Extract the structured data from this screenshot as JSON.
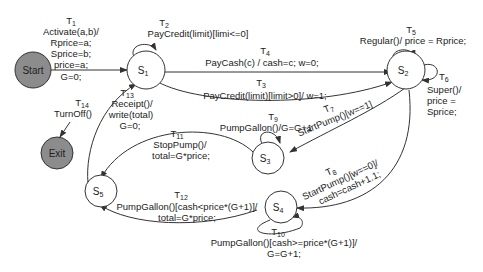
{
  "diagram": {
    "type": "state-machine",
    "colors": {
      "terminal_fill": "#8c8c8c",
      "state_fill": "#ffffff",
      "stroke": "#333333"
    },
    "states": {
      "start": "Start",
      "exit": "Exit",
      "s1": "S",
      "s1_sub": "1",
      "s2": "S",
      "s2_sub": "2",
      "s3": "S",
      "s3_sub": "3",
      "s4": "S",
      "s4_sub": "4",
      "s5": "S",
      "s5_sub": "5"
    },
    "transitions": {
      "t1": {
        "id": "T",
        "sub": "1",
        "lines": [
          "Activate(a,b)/",
          "Rprice=a;",
          "Sprice=b;",
          "price=a;",
          "G=0;"
        ]
      },
      "t2": {
        "id": "T",
        "sub": "2",
        "lines": [
          "PayCredit(limit)[limi<=0]"
        ]
      },
      "t3": {
        "id": "T",
        "sub": "3",
        "lines": [
          "PayCredit(limit)[limit>0]/ w=1;"
        ]
      },
      "t4": {
        "id": "T",
        "sub": "4",
        "lines": [
          "PayCash(c) / cash=c; w=0;"
        ]
      },
      "t5": {
        "id": "T",
        "sub": "5",
        "lines": [
          "Regular()/ price = Rprice;"
        ]
      },
      "t6": {
        "id": "T",
        "sub": "6",
        "lines": [
          "Super()/",
          "price =",
          "Sprice;"
        ]
      },
      "t7": {
        "id": "T",
        "sub": "7",
        "lines": [
          "StartPump()[w==1]"
        ]
      },
      "t8": {
        "id": "T",
        "sub": "8",
        "lines": [
          "StartPump()[w==0]/",
          "cash=cash+1.1;"
        ]
      },
      "t9": {
        "id": "T",
        "sub": "9",
        "lines": [
          "PumpGallon()/G=G+1"
        ]
      },
      "t10": {
        "id": "T",
        "sub": "10",
        "lines": [
          "PumpGallon()[cash>=price*(G+1)]/",
          "G=G+1;"
        ]
      },
      "t11": {
        "id": "T",
        "sub": "11",
        "lines": [
          "StopPump()/",
          "total=G*price;"
        ]
      },
      "t12": {
        "id": "T",
        "sub": "12",
        "lines": [
          "PumpGallon()[cash<price*(G+1)]/",
          "total=G*price;"
        ]
      },
      "t13": {
        "id": "T",
        "sub": "13",
        "lines": [
          "Receipt()/",
          "write(total)",
          "G=0;"
        ]
      },
      "t14": {
        "id": "T",
        "sub": "14",
        "lines": [
          "TurnOff()"
        ]
      }
    }
  }
}
